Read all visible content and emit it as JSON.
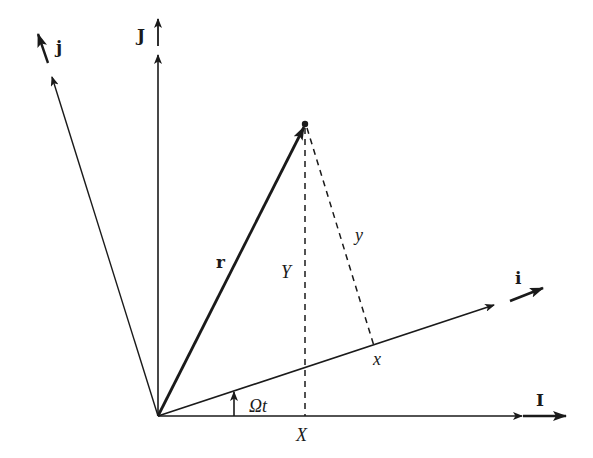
{
  "diagram": {
    "colors": {
      "ink": "#1a1a1a",
      "background": "#ffffff"
    },
    "origin": [
      158,
      416
    ],
    "inertial_axes": [
      {
        "name": "I",
        "label": "I",
        "direction": "horizontal"
      },
      {
        "name": "J",
        "label": "J",
        "direction": "vertical"
      }
    ],
    "rotating_axes": [
      {
        "name": "i",
        "label": "i"
      },
      {
        "name": "j",
        "label": "j"
      }
    ],
    "vector": {
      "name": "r",
      "label": "r",
      "tip": [
        305,
        124
      ]
    },
    "projections": {
      "X_label": "X",
      "Y_label": "Y",
      "x_label": "x",
      "y_label": "y"
    },
    "angle": {
      "label": "Ωt"
    }
  }
}
